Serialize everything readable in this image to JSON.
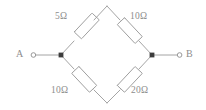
{
  "figure": {
    "type": "circuit-diagram",
    "name": "wheatstone-bridge-network",
    "background_color": "#ffffff",
    "stroke_color": "#9a9a9a",
    "text_color": "#8d8d8d",
    "node_color": "#3c3c3c",
    "width": 206,
    "height": 110
  },
  "terminals": [
    {
      "id": "a",
      "label": "A",
      "marker": "open-circle",
      "x": 33,
      "y": 55
    },
    {
      "id": "b",
      "label": "B",
      "marker": "open-circle",
      "x": 180,
      "y": 55
    }
  ],
  "nodes": [
    {
      "id": "top",
      "marker": "none",
      "x": 107,
      "y": 6
    },
    {
      "id": "left",
      "marker": "filled-square",
      "x": 61,
      "y": 55
    },
    {
      "id": "right",
      "marker": "filled-square",
      "x": 152,
      "y": 55
    },
    {
      "id": "bottom",
      "marker": "none",
      "x": 107,
      "y": 103
    }
  ],
  "resistors": [
    {
      "id": "r-top-left",
      "value": "5Ω",
      "resistance": 5,
      "unit": "Ω",
      "arm": "left-to-top"
    },
    {
      "id": "r-top-right",
      "value": "10Ω",
      "resistance": 10,
      "unit": "Ω",
      "arm": "top-to-right"
    },
    {
      "id": "r-bottom-left",
      "value": "10Ω",
      "resistance": 10,
      "unit": "Ω",
      "arm": "left-to-bottom"
    },
    {
      "id": "r-bottom-right",
      "value": "20Ω",
      "resistance": 20,
      "unit": "Ω",
      "arm": "bottom-to-right"
    }
  ]
}
